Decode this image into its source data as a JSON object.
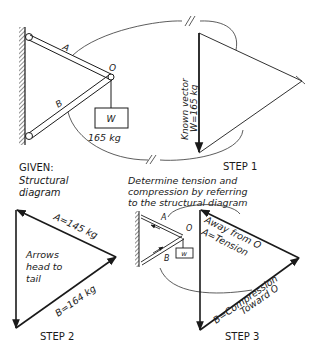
{
  "given": {
    "member_a": "A",
    "member_b": "B",
    "joint": "O",
    "weight_label": "W",
    "weight_value": "165 kg",
    "caption_title": "GIVEN:",
    "caption_line1": "Structural",
    "caption_line2": "diagram"
  },
  "step1": {
    "vector_line1": "Known vector",
    "vector_line2": "W=165 kg",
    "caption": "STEP 1"
  },
  "instruction": {
    "line1": "Determine tension and",
    "line2": "compression by referring",
    "line3": "to the structural diagram"
  },
  "step2": {
    "a_label": "A=145 kg",
    "b_label": "B=164 kg",
    "note_line1": "Arrows",
    "note_line2": "head to",
    "note_line3": "tail",
    "caption": "STEP 2"
  },
  "step3": {
    "mini_a": "A",
    "mini_b": "B",
    "mini_o": "O",
    "mini_w": "w",
    "a_line1": "Away from O",
    "a_line2": "A=Tension",
    "b_line1": "B=Compression",
    "b_line2": "Toward O",
    "caption": "STEP 3"
  },
  "colors": {
    "ink": "#1a1a1a",
    "background": "#ffffff"
  }
}
